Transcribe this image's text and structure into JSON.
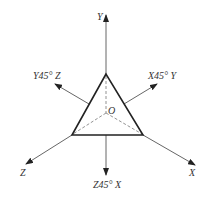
{
  "diagram": {
    "origin_label": "O",
    "axes": [
      {
        "id": "y",
        "label": "Y"
      },
      {
        "id": "x",
        "label": "X"
      },
      {
        "id": "z",
        "label": "Z"
      },
      {
        "id": "x45y",
        "label": "X45° Y"
      },
      {
        "id": "y45z",
        "label": "Y45° Z"
      },
      {
        "id": "z45x",
        "label": "Z45° X"
      }
    ]
  }
}
